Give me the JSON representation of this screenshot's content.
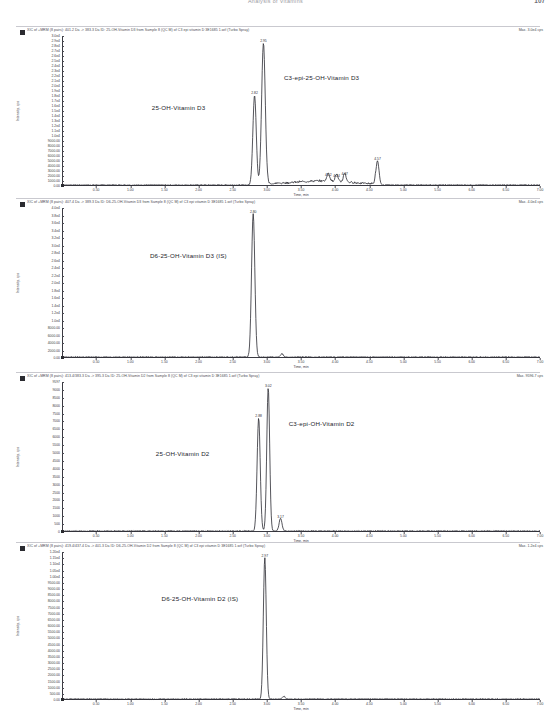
{
  "header": {
    "title": "Analysis of Vitamins",
    "page_number": "107"
  },
  "axis": {
    "xlabel": "Time, min",
    "ylabel": "Intensity, cps"
  },
  "panels": [
    {
      "id": "panel-1",
      "caption": "XIC of +MRM (8 pairs): 401.2 Da -> 383.3 Da ID: 25-OH-Vitamin D3 from Sample 8 (QC M) of C3 epi vitamin D 3E1685 1.wif (Turbo Spray)",
      "max_label": "Max. 3.0e4 cps",
      "analytes": [
        {
          "label": "25-OH-Vitamin D3",
          "x_min": 2.82
        },
        {
          "label": "C3-epi-25-OH-Vitamin D3",
          "x_min": 2.95
        }
      ],
      "ylim": [
        0,
        30000
      ],
      "yticks": [
        "3.0e4",
        "2.9e4",
        "2.8e4",
        "2.7e4",
        "2.6e4",
        "2.5e4",
        "2.4e4",
        "2.3e4",
        "2.2e4",
        "2.1e4",
        "2.0e4",
        "1.9e4",
        "1.8e4",
        "1.7e4",
        "1.6e4",
        "1.5e4",
        "1.4e4",
        "1.3e4",
        "1.2e4",
        "1.1e4",
        "1.0e4",
        "9000.00",
        "8000.00",
        "7000.00",
        "6000.00",
        "5000.00",
        "4000.00",
        "3000.00",
        "2000.00",
        "1000.00",
        "0.00"
      ],
      "peaks": [
        {
          "rt": "2.82",
          "x": 2.82,
          "h": 0.62,
          "w": 0.035
        },
        {
          "rt": "2.95",
          "x": 2.95,
          "h": 0.98,
          "w": 0.038
        },
        {
          "rt": "4.12",
          "x": 3.9,
          "h": 0.055,
          "w": 0.03
        },
        {
          "rt": "4.24",
          "x": 4.02,
          "h": 0.05,
          "w": 0.028
        },
        {
          "rt": "4.37",
          "x": 4.14,
          "h": 0.06,
          "w": 0.028
        },
        {
          "rt": "4.57",
          "x": 4.62,
          "h": 0.165,
          "w": 0.032
        }
      ]
    },
    {
      "id": "panel-2",
      "caption": "XIC of +MRM (8 pairs): 407.4 Da -> 389.3 Da ID: D6-25-OH-Vitamin D3 from Sample 8 (QC M) of C3 epi vitamin D 3E1685 1.wif (Turbo Spray)",
      "max_label": "Max. 4.0e4 cps",
      "analytes": [
        {
          "label": "D6-25-OH-Vitamin D3 (IS)",
          "x_min": 2.8
        }
      ],
      "ylim": [
        0,
        40000
      ],
      "yticks": [
        "4.0e4",
        "3.8e4",
        "3.6e4",
        "3.4e4",
        "3.2e4",
        "3.0e4",
        "2.8e4",
        "2.6e4",
        "2.4e4",
        "2.2e4",
        "2.0e4",
        "1.8e4",
        "1.6e4",
        "1.4e4",
        "1.2e4",
        "1.0e4",
        "8000.00",
        "6000.00",
        "4000.00",
        "2000.00",
        "0.00"
      ],
      "peaks": [
        {
          "rt": "2.80",
          "x": 2.8,
          "h": 0.99,
          "w": 0.034
        },
        {
          "rt": "",
          "x": 3.22,
          "h": 0.022,
          "w": 0.03
        }
      ]
    },
    {
      "id": "panel-3",
      "caption": "XIC of +MRM (8 pairs): 413.4/383.3 Da -> 395.3 Da ID: 25-OH-Vitamin D2 from Sample 8 (QC M) of C3 epi vitamin D 3E1685 1.wif (Turbo Spray)",
      "max_label": "Max. 9596.7 cps",
      "analytes": [
        {
          "label": "25-OH-Vitamin D2",
          "x_min": 2.88
        },
        {
          "label": "C3-epi-OH-Vitamin D2",
          "x_min": 3.02
        }
      ],
      "ylim": [
        0,
        9500
      ],
      "yticks": [
        "9597",
        "9000",
        "8500",
        "8000",
        "7500",
        "7000",
        "6500",
        "6000",
        "5500",
        "5000",
        "4500",
        "4000",
        "3500",
        "3000",
        "2500",
        "2000",
        "1500",
        "1000",
        "500",
        "0"
      ],
      "peaks": [
        {
          "rt": "2.88",
          "x": 2.88,
          "h": 0.78,
          "w": 0.032
        },
        {
          "rt": "3.02",
          "x": 3.02,
          "h": 0.99,
          "w": 0.03
        },
        {
          "rt": "3.17",
          "x": 3.2,
          "h": 0.085,
          "w": 0.03
        }
      ]
    },
    {
      "id": "panel-4",
      "caption": "XIC of +MRM (8 pairs): 419.4/437.4 Da -> 401.3 Da ID: D6-25-OH-Vitamin D2 from Sample 8 (QC M) of C3 epi vitamin D 3E1685 1.wif (Turbo Spray)",
      "max_label": "Max. 1.2e4 cps",
      "analytes": [
        {
          "label": "D6-25-OH-Vitamin D2 (IS)",
          "x_min": 2.97
        }
      ],
      "ylim": [
        0,
        12000
      ],
      "yticks": [
        "1.20e4",
        "1.15e4",
        "1.10e4",
        "1.05e4",
        "1.00e4",
        "9500.00",
        "9000.00",
        "8500.00",
        "8000.00",
        "7500.00",
        "7000.00",
        "6500.00",
        "6000.00",
        "5500.00",
        "5000.00",
        "4500.00",
        "4000.00",
        "3500.00",
        "3000.00",
        "2500.00",
        "2000.00",
        "1500.00",
        "1000.00",
        "500.00",
        "0.00"
      ],
      "peaks": [
        {
          "rt": "2.97",
          "x": 2.97,
          "h": 0.99,
          "w": 0.03
        },
        {
          "rt": "",
          "x": 3.25,
          "h": 0.018,
          "w": 0.028
        }
      ]
    }
  ],
  "chart_data": {
    "type": "line",
    "xlabel": "Time, min",
    "ylabel": "Intensity, cps",
    "xlim": [
      0,
      7.0
    ],
    "xticks": [
      0.5,
      1.0,
      1.5,
      2.0,
      2.5,
      3.0,
      3.5,
      4.0,
      4.5,
      5.0,
      5.5,
      6.0,
      6.5,
      7.0
    ],
    "grid": false,
    "legend": "none",
    "series": [
      {
        "name": "XIC 401.2 -> 383.3 (25-OH-Vitamin D3 / C3-epi-25-OH-Vitamin D3)",
        "panel": 1,
        "ymax_cps": 30000,
        "peaks": [
          {
            "analyte": "25-OH-Vitamin D3",
            "rt_min": 2.82,
            "intensity_cps": 18600
          },
          {
            "analyte": "C3-epi-25-OH-Vitamin D3",
            "rt_min": 2.95,
            "intensity_cps": 29400
          },
          {
            "analyte": "unknown",
            "rt_min": 4.12,
            "intensity_cps": 1650
          },
          {
            "analyte": "unknown",
            "rt_min": 4.24,
            "intensity_cps": 1500
          },
          {
            "analyte": "unknown",
            "rt_min": 4.37,
            "intensity_cps": 1800
          },
          {
            "analyte": "unknown",
            "rt_min": 4.57,
            "intensity_cps": 4950
          }
        ]
      },
      {
        "name": "XIC 407.4 -> 389.3 (D6-25-OH-Vitamin D3 IS)",
        "panel": 2,
        "ymax_cps": 40000,
        "peaks": [
          {
            "analyte": "D6-25-OH-Vitamin D3 (IS)",
            "rt_min": 2.8,
            "intensity_cps": 39600
          }
        ]
      },
      {
        "name": "XIC 413.4/383.3 -> 395.3 (25-OH-Vitamin D2 / C3-epi-OH-Vitamin D2)",
        "panel": 3,
        "ymax_cps": 9597,
        "peaks": [
          {
            "analyte": "25-OH-Vitamin D2",
            "rt_min": 2.88,
            "intensity_cps": 7490
          },
          {
            "analyte": "C3-epi-OH-Vitamin D2",
            "rt_min": 3.02,
            "intensity_cps": 9500
          },
          {
            "analyte": "unknown",
            "rt_min": 3.17,
            "intensity_cps": 815
          }
        ]
      },
      {
        "name": "XIC 419.4/437.4 -> 401.3 (D6-25-OH-Vitamin D2 IS)",
        "panel": 4,
        "ymax_cps": 12000,
        "peaks": [
          {
            "analyte": "D6-25-OH-Vitamin D2 (IS)",
            "rt_min": 2.97,
            "intensity_cps": 11880
          }
        ]
      }
    ]
  }
}
